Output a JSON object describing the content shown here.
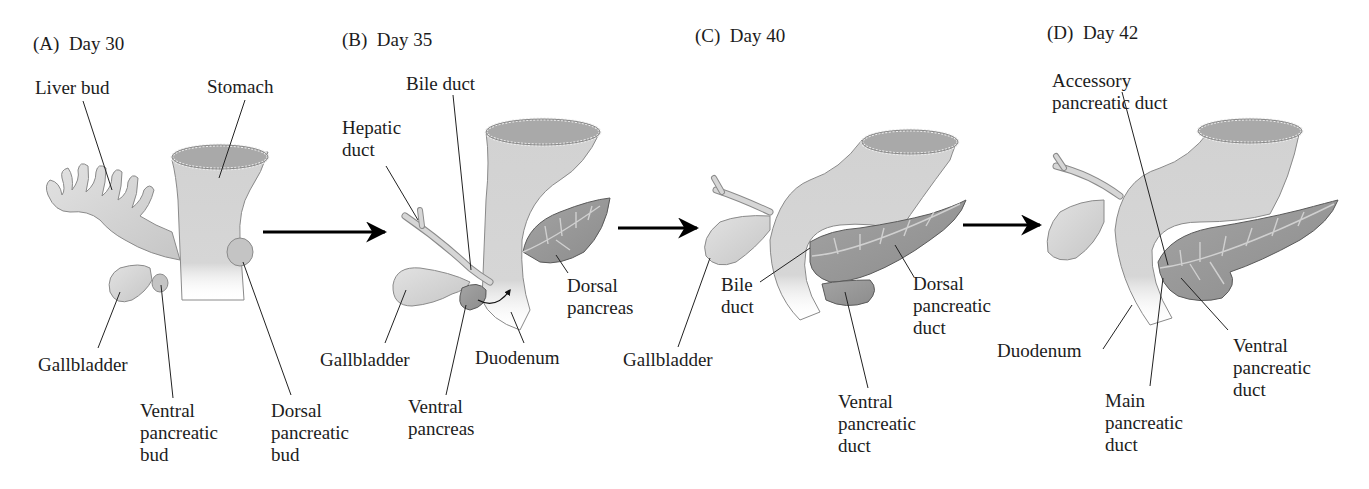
{
  "figure": {
    "colors": {
      "organ_fill": "#d4d4d4",
      "organ_stroke": "#8a8a8a",
      "pancreas_fill": "#9a9a9a",
      "pancreas_stroke": "#5a5a5a",
      "lumen_fill": "#a8a8a8",
      "leader_line": "#222222",
      "arrow": "#000000"
    },
    "panels": [
      {
        "id": "A",
        "title": "(A)  Day 30",
        "labels": {
          "liver_bud": "Liver bud",
          "stomach": "Stomach",
          "gallbladder": "Gallbladder",
          "ventral_pancreatic_bud": "Ventral\npancreatic\nbud",
          "dorsal_pancreatic_bud": "Dorsal\npancreatic\nbud"
        }
      },
      {
        "id": "B",
        "title": "(B)  Day 35",
        "labels": {
          "bile_duct": "Bile duct",
          "hepatic_duct": "Hepatic\nduct",
          "gallbladder": "Gallbladder",
          "ventral_pancreas": "Ventral\npancreas",
          "duodenum": "Duodenum",
          "dorsal_pancreas": "Dorsal\npancreas"
        }
      },
      {
        "id": "C",
        "title": "(C)  Day 40",
        "labels": {
          "gallbladder": "Gallbladder",
          "bile_duct": "Bile\nduct",
          "dorsal_pancreatic_duct": "Dorsal\npancreatic\nduct",
          "ventral_pancreatic_duct": "Ventral\npancreatic\nduct"
        }
      },
      {
        "id": "D",
        "title": "(D)  Day 42",
        "labels": {
          "accessory_pancreatic_duct": "Accessory\npancreatic duct",
          "duodenum": "Duodenum",
          "main_pancreatic_duct": "Main\npancreatic\nduct",
          "ventral_pancreatic_duct": "Ventral\npancreatic\nduct"
        }
      }
    ],
    "arrows": [
      {
        "from": "A",
        "to": "B"
      },
      {
        "from": "B",
        "to": "C"
      },
      {
        "from": "C",
        "to": "D"
      }
    ]
  }
}
